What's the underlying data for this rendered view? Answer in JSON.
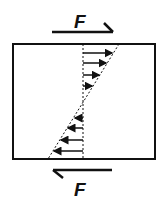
{
  "diagram": {
    "top_force": {
      "label": "F",
      "direction": "right"
    },
    "bottom_force": {
      "label": "F",
      "direction": "left"
    },
    "colors": {
      "stroke": "#111111",
      "background": "#ffffff"
    }
  }
}
